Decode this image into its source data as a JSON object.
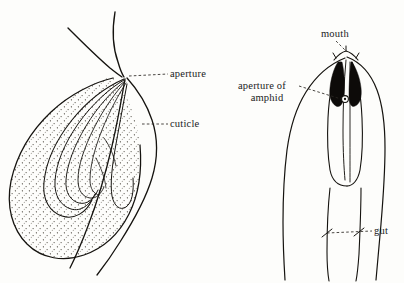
{
  "figure": {
    "background_color": "#fdfdfb",
    "ink_color": "#15130f",
    "type": "scientific-line-drawing",
    "panels": [
      {
        "id": "left-panel",
        "name": "lateral-amphid-section",
        "description": "Lateral sectional view of nematode amphid: stippled amphidial pouch with converging sensory dendrite lines meeting at the aperture, and a tapering cuticular lobe.",
        "labels": [
          {
            "id": "aperture",
            "text": "aperture"
          },
          {
            "id": "cuticle",
            "text": "cuticle"
          }
        ]
      },
      {
        "id": "right-panel",
        "name": "head-end-view",
        "description": "Head end of nematode showing mouth at apex, paired black amphidial pouches, the aperture of the amphid pore, body wall outlines and the gut.",
        "labels": [
          {
            "id": "mouth",
            "text": "mouth"
          },
          {
            "id": "aperture-of-amphid-line1",
            "text": "aperture of"
          },
          {
            "id": "aperture-of-amphid-line2",
            "text": "amphid"
          },
          {
            "id": "gut",
            "text": "gut"
          }
        ]
      }
    ]
  },
  "labels": {
    "aperture": "aperture",
    "cuticle": "cuticle",
    "mouth": "mouth",
    "aperture_of": "aperture of",
    "amphid": "amphid",
    "gut": "gut"
  }
}
